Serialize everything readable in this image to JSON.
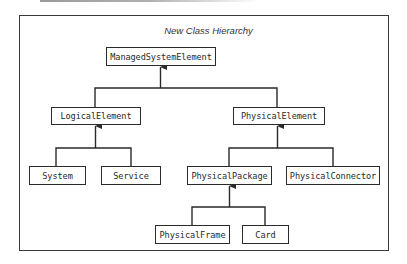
{
  "diagram": {
    "title": "New Class Hierarchy",
    "nodes": {
      "managed_system_element": "ManagedSystemElement",
      "logical_element": "LogicalElement",
      "physical_element": "PhysicalElement",
      "system": "System",
      "service": "Service",
      "physical_package": "PhysicalPackage",
      "physical_connector": "PhysicalConnector",
      "physical_frame": "PhysicalFrame",
      "card": "Card"
    },
    "edges": [
      {
        "from": "LogicalElement",
        "to": "ManagedSystemElement",
        "type": "inheritance"
      },
      {
        "from": "PhysicalElement",
        "to": "ManagedSystemElement",
        "type": "inheritance"
      },
      {
        "from": "System",
        "to": "LogicalElement",
        "type": "inheritance"
      },
      {
        "from": "Service",
        "to": "LogicalElement",
        "type": "inheritance"
      },
      {
        "from": "PhysicalPackage",
        "to": "PhysicalElement",
        "type": "inheritance"
      },
      {
        "from": "PhysicalConnector",
        "to": "PhysicalElement",
        "type": "inheritance"
      },
      {
        "from": "PhysicalFrame",
        "to": "PhysicalPackage",
        "type": "inheritance"
      },
      {
        "from": "Card",
        "to": "PhysicalPackage",
        "type": "inheritance"
      }
    ],
    "colors": {
      "line": "#2a2a2a",
      "background": "#ffffff"
    }
  }
}
